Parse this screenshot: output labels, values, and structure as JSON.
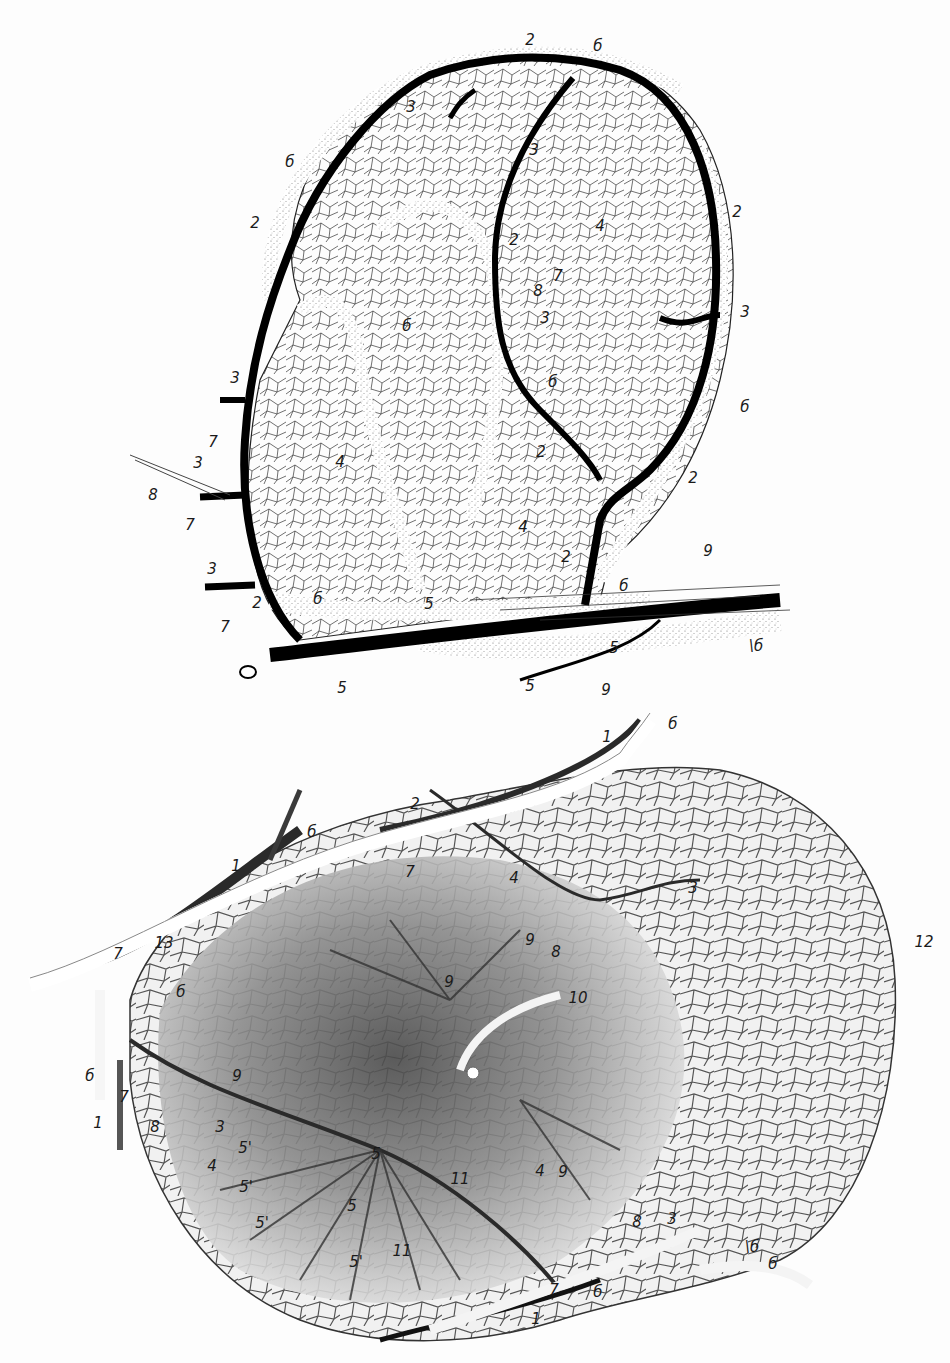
{
  "figures": [
    {
      "id": "top",
      "description": "Lymph node vascular network, ink line drawing",
      "labels": [
        {
          "text": "2",
          "x": 530,
          "y": 40
        },
        {
          "text": "б",
          "x": 598,
          "y": 46
        },
        {
          "text": "3",
          "x": 411,
          "y": 107
        },
        {
          "text": "3",
          "x": 534,
          "y": 150
        },
        {
          "text": "б",
          "x": 290,
          "y": 162
        },
        {
          "text": "2",
          "x": 255,
          "y": 223
        },
        {
          "text": "2",
          "x": 514,
          "y": 240
        },
        {
          "text": "4",
          "x": 600,
          "y": 226
        },
        {
          "text": "2",
          "x": 737,
          "y": 212
        },
        {
          "text": "7",
          "x": 558,
          "y": 276
        },
        {
          "text": "8",
          "x": 538,
          "y": 291
        },
        {
          "text": "3",
          "x": 545,
          "y": 318
        },
        {
          "text": "3",
          "x": 745,
          "y": 312
        },
        {
          "text": "б",
          "x": 407,
          "y": 326
        },
        {
          "text": "3",
          "x": 235,
          "y": 378
        },
        {
          "text": "б",
          "x": 553,
          "y": 382
        },
        {
          "text": "б",
          "x": 745,
          "y": 407
        },
        {
          "text": "4",
          "x": 340,
          "y": 462
        },
        {
          "text": "7",
          "x": 213,
          "y": 442
        },
        {
          "text": "3",
          "x": 198,
          "y": 463
        },
        {
          "text": "8",
          "x": 153,
          "y": 495
        },
        {
          "text": "2",
          "x": 541,
          "y": 452
        },
        {
          "text": "2",
          "x": 693,
          "y": 478
        },
        {
          "text": "7",
          "x": 190,
          "y": 525
        },
        {
          "text": "4",
          "x": 523,
          "y": 527
        },
        {
          "text": "2",
          "x": 566,
          "y": 557
        },
        {
          "text": "9",
          "x": 708,
          "y": 551
        },
        {
          "text": "3",
          "x": 212,
          "y": 569
        },
        {
          "text": "б",
          "x": 624,
          "y": 586
        },
        {
          "text": "2",
          "x": 257,
          "y": 603
        },
        {
          "text": "б",
          "x": 318,
          "y": 599
        },
        {
          "text": "5",
          "x": 429,
          "y": 604
        },
        {
          "text": "7",
          "x": 225,
          "y": 627
        },
        {
          "text": "5",
          "x": 614,
          "y": 648
        },
        {
          "text": "\\б",
          "x": 756,
          "y": 646
        },
        {
          "text": "5",
          "x": 342,
          "y": 688
        },
        {
          "text": "5",
          "x": 530,
          "y": 686
        },
        {
          "text": "9",
          "x": 606,
          "y": 690
        }
      ]
    },
    {
      "id": "bottom",
      "description": "Lymph node blood vessels, shaded illustration",
      "labels": [
        {
          "text": "1",
          "x": 607,
          "y": 737
        },
        {
          "text": "б",
          "x": 673,
          "y": 724
        },
        {
          "text": "2",
          "x": 415,
          "y": 804
        },
        {
          "text": "б",
          "x": 312,
          "y": 832
        },
        {
          "text": "1",
          "x": 236,
          "y": 866
        },
        {
          "text": "7",
          "x": 410,
          "y": 872
        },
        {
          "text": "4",
          "x": 514,
          "y": 878
        },
        {
          "text": "3",
          "x": 693,
          "y": 888
        },
        {
          "text": "13",
          "x": 164,
          "y": 943
        },
        {
          "text": "7",
          "x": 118,
          "y": 954
        },
        {
          "text": "12",
          "x": 924,
          "y": 942
        },
        {
          "text": "9",
          "x": 530,
          "y": 940
        },
        {
          "text": "8",
          "x": 556,
          "y": 952
        },
        {
          "text": "б",
          "x": 181,
          "y": 992
        },
        {
          "text": "9",
          "x": 449,
          "y": 982
        },
        {
          "text": "10",
          "x": 578,
          "y": 998
        },
        {
          "text": "б",
          "x": 90,
          "y": 1076
        },
        {
          "text": "9",
          "x": 237,
          "y": 1076
        },
        {
          "text": "7",
          "x": 124,
          "y": 1097
        },
        {
          "text": "1",
          "x": 98,
          "y": 1123
        },
        {
          "text": "8",
          "x": 155,
          "y": 1127
        },
        {
          "text": "3",
          "x": 220,
          "y": 1127
        },
        {
          "text": "5'",
          "x": 245,
          "y": 1148
        },
        {
          "text": "4",
          "x": 212,
          "y": 1166
        },
        {
          "text": "5",
          "x": 376,
          "y": 1154
        },
        {
          "text": "5'",
          "x": 246,
          "y": 1187
        },
        {
          "text": "11",
          "x": 460,
          "y": 1179
        },
        {
          "text": "4",
          "x": 540,
          "y": 1171
        },
        {
          "text": "9",
          "x": 563,
          "y": 1172
        },
        {
          "text": "5",
          "x": 352,
          "y": 1206
        },
        {
          "text": "5'",
          "x": 262,
          "y": 1223
        },
        {
          "text": "11",
          "x": 402,
          "y": 1251
        },
        {
          "text": "5'",
          "x": 356,
          "y": 1262
        },
        {
          "text": "8",
          "x": 637,
          "y": 1222
        },
        {
          "text": "3",
          "x": 672,
          "y": 1219
        },
        {
          "text": "\\б",
          "x": 752,
          "y": 1247
        },
        {
          "text": "б",
          "x": 773,
          "y": 1264
        },
        {
          "text": "7",
          "x": 554,
          "y": 1290
        },
        {
          "text": "б",
          "x": 598,
          "y": 1292
        },
        {
          "text": "1",
          "x": 536,
          "y": 1319
        }
      ]
    }
  ]
}
